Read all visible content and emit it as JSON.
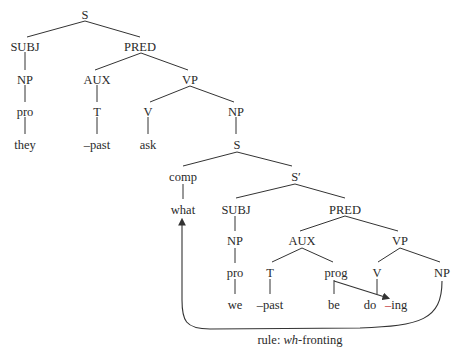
{
  "diagram": {
    "type": "syntax-tree",
    "caption_prefix": "rule: ",
    "caption_italic": "wh",
    "caption_suffix": "-fronting",
    "nodes": {
      "s_root": "S",
      "subj1": "SUBJ",
      "pred1": "PRED",
      "np1": "NP",
      "aux1": "AUX",
      "vp1": "VP",
      "pro1": "pro",
      "t1": "T",
      "v1": "V",
      "np2": "NP",
      "they": "they",
      "past1": "–past",
      "ask": "ask",
      "s2": "S",
      "comp": "comp",
      "sbar": "S′",
      "what": "what",
      "subj2": "SUBJ",
      "pred2": "PRED",
      "np3": "NP",
      "aux2": "AUX",
      "vp2": "VP",
      "pro2": "pro",
      "t2": "T",
      "prog": "prog",
      "v2": "V",
      "np4": "NP",
      "we": "we",
      "past2": "–past",
      "be": "be",
      "do": "do",
      "ing": "–ing"
    },
    "colors": {
      "text": "#2a2a2a",
      "lines": "#333333",
      "ing_dash": "#c0282d"
    }
  }
}
